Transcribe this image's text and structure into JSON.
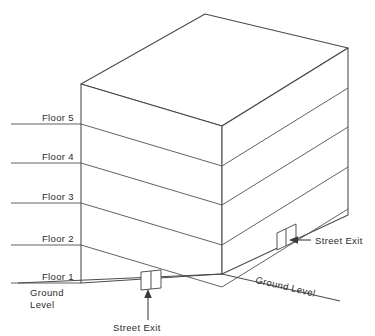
{
  "diagram": {
    "style": {
      "stroke_color": "#4a4a4a",
      "text_color": "#2b2b2b",
      "background": "#ffffff"
    },
    "floor_labels": [
      {
        "id": "floor-5",
        "text": "Floor 5",
        "y": 124
      },
      {
        "id": "floor-4",
        "text": "Floor 4",
        "y": 163
      },
      {
        "id": "floor-3",
        "text": "Floor 3",
        "y": 203
      },
      {
        "id": "floor-2",
        "text": "Floor 2",
        "y": 245
      },
      {
        "id": "floor-1",
        "text": "Floor 1",
        "y": 283
      }
    ],
    "ground_label_left": {
      "line1": "Ground",
      "line2": "Level"
    },
    "ground_label_right": {
      "text": "Ground Level"
    },
    "callouts": [
      {
        "id": "street-exit-front",
        "text": "Street Exit"
      },
      {
        "id": "street-exit-right",
        "text": "Street Exit"
      }
    ],
    "geometry": {
      "left_front_edge_x": 81,
      "right_rear_edge_x": 348,
      "front_apex_x": 222,
      "roof_back_apex": [
        205,
        14
      ],
      "building_top_left": [
        81,
        84
      ],
      "building_bottom_left": [
        81,
        283
      ],
      "building_bottom_front": [
        222,
        274
      ],
      "building_bottom_right": [
        348,
        215
      ],
      "building_top_right": [
        348,
        48
      ]
    }
  }
}
